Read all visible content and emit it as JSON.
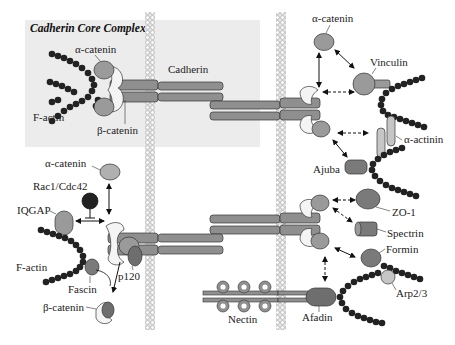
{
  "title": "Cadherin Core Complex",
  "colors": {
    "core_box": "#ececec",
    "membrane": "#d2d2d2",
    "protein_mid": "#9a9a9a",
    "protein_dark": "#6e6e6e",
    "protein_light": "#c6c6c6",
    "actin": "#222222",
    "catenin_white": "#f2f2f2"
  },
  "labels": {
    "alpha_catenin_core": "α-catenin",
    "beta_catenin_core": "β-catenin",
    "f_actin_core": "F-actin",
    "cadherin": "Cadherin",
    "alpha_catenin_top_right": "α-catenin",
    "vinculin": "Vinculin",
    "alpha_actinin": "α-actinin",
    "ajuba": "Ajuba",
    "zo1": "ZO-1",
    "spectrin": "Spectrin",
    "formin": "Formin",
    "arp23": "Arp2/3",
    "afadin": "Afadin",
    "nectin": "Nectin",
    "alpha_catenin_left": "α-catenin",
    "rac1_cdc42": "Rac1/Cdc42",
    "iqgap": "IQGAP",
    "f_actin_left": "F-actin",
    "fascin": "Fascin",
    "p120": "p120",
    "beta_catenin_left": "β-catenin"
  }
}
